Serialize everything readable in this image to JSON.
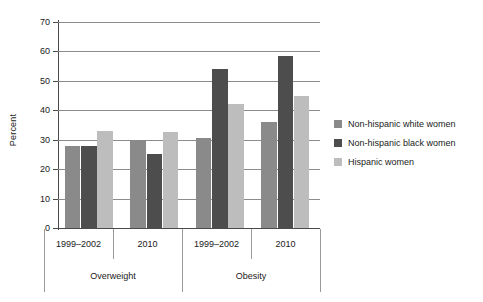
{
  "chart_data": {
    "type": "bar",
    "title": "",
    "xlabel": "",
    "ylabel": "Percent",
    "ylim": [
      0,
      70
    ],
    "yticks": [
      0,
      10,
      20,
      30,
      40,
      50,
      60,
      70
    ],
    "grid": true,
    "legend_position": "right",
    "group_labels": [
      "Overweight",
      "Obesity"
    ],
    "categories": [
      "1999–2002",
      "2010",
      "1999–2002",
      "2010"
    ],
    "category_groups": [
      {
        "label": "Overweight",
        "periods": [
          "1999–2002",
          "2010"
        ]
      },
      {
        "label": "Obesity",
        "periods": [
          "1999–2002",
          "2010"
        ]
      }
    ],
    "series": [
      {
        "name": "Non-hispanic white women",
        "color": "#8a8a8a",
        "values": [
          27.9,
          30.0,
          30.5,
          36.0
        ]
      },
      {
        "name": "Non-hispanic black women",
        "color": "#4d4d4d",
        "values": [
          27.7,
          25.0,
          54.0,
          58.4
        ]
      },
      {
        "name": "Hispanic women",
        "color": "#bdbdbd",
        "values": [
          33.1,
          32.7,
          42.3,
          44.7
        ]
      }
    ]
  },
  "axis": {
    "y_title": "Percent",
    "tick_labels": [
      "70",
      "60",
      "50",
      "40",
      "30",
      "20",
      "10",
      "0"
    ]
  },
  "legend": {
    "items": [
      {
        "label": "Non-hispanic white women",
        "color": "#8a8a8a",
        "swatch": "legend-swatch-white-women"
      },
      {
        "label": "Non-hispanic black women",
        "color": "#4d4d4d",
        "swatch": "legend-swatch-black-women"
      },
      {
        "label": "Hispanic women",
        "color": "#bdbdbd",
        "swatch": "legend-swatch-hispanic-women"
      }
    ]
  },
  "category_axis": {
    "periods": [
      "1999–2002",
      "2010",
      "1999–2002",
      "2010"
    ],
    "groups": [
      "Overweight",
      "Obesity"
    ]
  },
  "colors": {
    "series_white": "#8a8a8a",
    "series_black": "#4d4d4d",
    "series_hispanic": "#bdbdbd",
    "gridline": "#8c8c8c",
    "axis": "#4a4a4a",
    "background": "#ffffff"
  }
}
